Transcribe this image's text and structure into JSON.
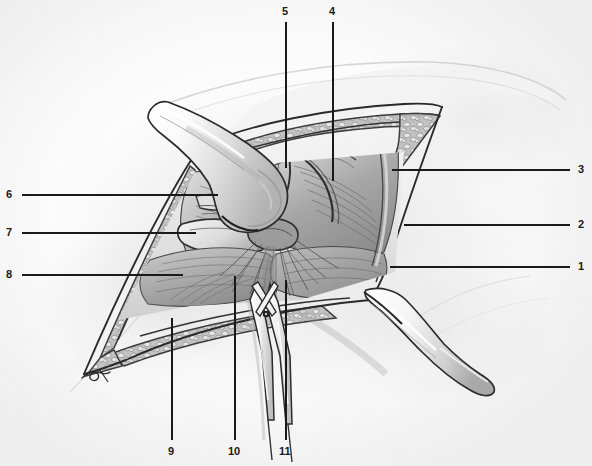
{
  "figure": {
    "style": "graphite pencil medical illustration, grayscale",
    "background_color": "#ffffff",
    "ink_color": "#1a1a1a",
    "signature": "CK"
  },
  "labels": [
    {
      "id": "1",
      "text": "1",
      "side": "right",
      "num_x": 578,
      "num_y": 261,
      "line_x1": 390,
      "line_y1": 267,
      "line_x2": 570,
      "line_y2": 267
    },
    {
      "id": "2",
      "text": "2",
      "side": "right",
      "num_x": 578,
      "num_y": 219,
      "line_x1": 404,
      "line_y1": 225,
      "line_x2": 570,
      "line_y2": 225
    },
    {
      "id": "3",
      "text": "3",
      "side": "right",
      "num_x": 578,
      "num_y": 164,
      "line_x1": 392,
      "line_y1": 170,
      "line_x2": 570,
      "line_y2": 170
    },
    {
      "id": "4",
      "text": "4",
      "side": "top",
      "num_x": 329,
      "num_y": 6,
      "line_x1": 333,
      "line_y1": 22,
      "line_x2": 333,
      "line_y2": 181
    },
    {
      "id": "5",
      "text": "5",
      "side": "top",
      "num_x": 282,
      "num_y": 6,
      "line_x1": 286,
      "line_y1": 22,
      "line_x2": 286,
      "line_y2": 168
    },
    {
      "id": "6",
      "text": "6",
      "side": "left",
      "num_x": 6,
      "num_y": 189,
      "line_x1": 22,
      "line_y1": 195,
      "line_x2": 218,
      "line_y2": 195
    },
    {
      "id": "7",
      "text": "7",
      "side": "left",
      "num_x": 6,
      "num_y": 227,
      "line_x1": 22,
      "line_y1": 233,
      "line_x2": 196,
      "line_y2": 233
    },
    {
      "id": "8",
      "text": "8",
      "side": "left",
      "num_x": 6,
      "num_y": 269,
      "line_x1": 22,
      "line_y1": 275,
      "line_x2": 183,
      "line_y2": 275
    },
    {
      "id": "9",
      "text": "9",
      "side": "bottom",
      "num_x": 168,
      "num_y": 446,
      "line_x1": 172,
      "line_y1": 318,
      "line_x2": 172,
      "line_y2": 440
    },
    {
      "id": "10",
      "text": "10",
      "side": "bottom",
      "num_x": 228,
      "num_y": 446,
      "line_x1": 235,
      "line_y1": 276,
      "line_x2": 235,
      "line_y2": 440
    },
    {
      "id": "11",
      "text": "11",
      "side": "bottom",
      "num_x": 279,
      "num_y": 446,
      "line_x1": 286,
      "line_y1": 280,
      "line_x2": 286,
      "line_y2": 440
    }
  ]
}
